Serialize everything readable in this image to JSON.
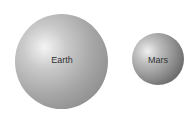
{
  "planets": [
    {
      "name": "Earth",
      "color": "#a6a6a6"
    },
    {
      "name": "Mars",
      "color": "#8f8f8f"
    }
  ]
}
